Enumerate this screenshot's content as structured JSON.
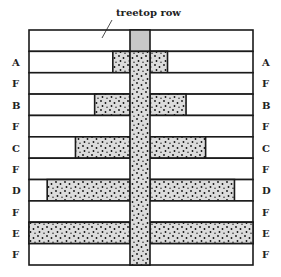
{
  "caption": "treetop row",
  "colors": {
    "line": "#1a1a1a",
    "shade": "#dcdcdc",
    "treetop": "#c8c8c8",
    "dot": "#111111"
  },
  "rows": [
    {
      "label": "",
      "kind": "treetop",
      "extent": 0
    },
    {
      "label": "A",
      "kind": "shaded",
      "extent": 0.17
    },
    {
      "label": "F",
      "kind": "plain",
      "extent": 0
    },
    {
      "label": "B",
      "kind": "shaded",
      "extent": 0.35
    },
    {
      "label": "F",
      "kind": "plain",
      "extent": 0
    },
    {
      "label": "C",
      "kind": "shaded",
      "extent": 0.54
    },
    {
      "label": "F",
      "kind": "plain",
      "extent": 0
    },
    {
      "label": "D",
      "kind": "shaded",
      "extent": 0.82
    },
    {
      "label": "F",
      "kind": "plain",
      "extent": 0
    },
    {
      "label": "E",
      "kind": "shaded",
      "extent": 1.0
    },
    {
      "label": "F",
      "kind": "plain",
      "extent": 0
    }
  ]
}
